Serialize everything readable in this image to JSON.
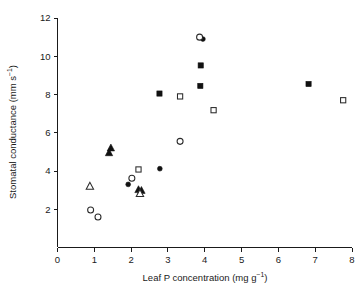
{
  "chart_data": {
    "type": "scatter",
    "title": "",
    "xlabel": "Leaf P concentration (mg g-1)",
    "xlabel_main": "Leaf P concentration (mg g",
    "xlabel_sup": "−1",
    "xlabel_tail": ")",
    "ylabel": "Stomatal conductance (mm s-1)",
    "ylabel_main": "Stomatal conductance (mm s",
    "ylabel_sup": "−1",
    "ylabel_tail": ")",
    "xlim": [
      0,
      8
    ],
    "ylim": [
      0,
      12
    ],
    "xticks": [
      0,
      1,
      2,
      3,
      4,
      5,
      6,
      7,
      8
    ],
    "yticks": [
      2,
      4,
      6,
      8,
      10,
      12
    ],
    "xtick_labels": [
      "0",
      "1",
      "2",
      "3",
      "4",
      "5",
      "6",
      "7",
      "8"
    ],
    "ytick_labels": [
      "2",
      "4",
      "6",
      "8",
      "10",
      "12"
    ],
    "grid": false,
    "legend": "none",
    "marker_color": "#111111",
    "axis_color": "#1a1a1a",
    "series": [
      {
        "name": "filled-circle",
        "marker": "filled-circle",
        "points": [
          {
            "x": 1.92,
            "y": 3.3
          },
          {
            "x": 2.78,
            "y": 4.12
          },
          {
            "x": 3.95,
            "y": 10.9
          }
        ]
      },
      {
        "name": "open-circle",
        "marker": "open-circle",
        "points": [
          {
            "x": 0.9,
            "y": 1.96
          },
          {
            "x": 1.1,
            "y": 1.6
          },
          {
            "x": 2.02,
            "y": 3.62
          },
          {
            "x": 3.33,
            "y": 5.55
          },
          {
            "x": 3.86,
            "y": 11.0
          }
        ]
      },
      {
        "name": "filled-triangle",
        "marker": "filled-triangle",
        "points": [
          {
            "x": 1.45,
            "y": 5.2
          },
          {
            "x": 1.4,
            "y": 4.95
          },
          {
            "x": 2.2,
            "y": 3.02
          },
          {
            "x": 2.28,
            "y": 2.98
          }
        ]
      },
      {
        "name": "open-triangle",
        "marker": "open-triangle",
        "points": [
          {
            "x": 0.88,
            "y": 3.2
          },
          {
            "x": 2.24,
            "y": 2.82
          }
        ]
      },
      {
        "name": "filled-square",
        "marker": "filled-square",
        "points": [
          {
            "x": 2.77,
            "y": 8.05
          },
          {
            "x": 3.88,
            "y": 8.45
          },
          {
            "x": 3.89,
            "y": 9.52
          },
          {
            "x": 6.82,
            "y": 8.55
          }
        ]
      },
      {
        "name": "open-square",
        "marker": "open-square",
        "points": [
          {
            "x": 2.2,
            "y": 4.08
          },
          {
            "x": 3.33,
            "y": 7.9
          },
          {
            "x": 4.24,
            "y": 7.18
          },
          {
            "x": 7.76,
            "y": 7.7
          }
        ]
      }
    ]
  }
}
